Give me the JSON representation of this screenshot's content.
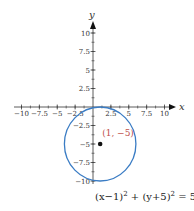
{
  "chart_data": {
    "type": "line",
    "title": "",
    "xlabel": "x",
    "ylabel": "y",
    "xlim": [
      -10,
      10
    ],
    "ylim": [
      -10,
      10
    ],
    "grid": false,
    "x_ticks": [
      -10,
      -7.5,
      -5,
      -2.5,
      2.5,
      5,
      7.5,
      10
    ],
    "x_tick_labels": [
      "−10",
      "−7.5",
      "−5",
      "−2.5",
      "2.5",
      "5",
      "7.5",
      "10"
    ],
    "y_ticks": [
      10,
      7.5,
      5,
      2.5,
      -2.5,
      -5,
      -7.5,
      -10
    ],
    "y_tick_labels": [
      "10",
      "7.5",
      "5",
      "2.5",
      "−2.5",
      "−5",
      "−7.5",
      "−10"
    ],
    "series": [
      {
        "name": "circle",
        "shape": "circle",
        "center": [
          1,
          -5
        ],
        "radius": 5,
        "color": "#3a7cc4"
      }
    ],
    "points": [
      {
        "x": 1,
        "y": -5,
        "label": "(1, −5)",
        "color": "#111111",
        "label_color": "#c0504d"
      }
    ],
    "equation": {
      "lhs1": "(x−1)",
      "exp1": "2",
      "plus": " + ",
      "lhs2": "(y+5)",
      "exp2": "2",
      "eq": " = 5",
      "exp3": "2"
    }
  }
}
